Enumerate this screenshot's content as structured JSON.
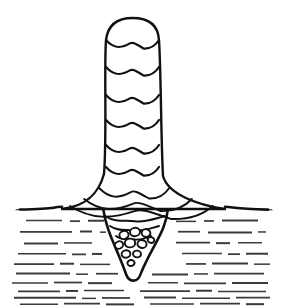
{
  "figure": {
    "medium": "pen-and-ink line drawing",
    "caption": "",
    "background_color": "#ffffff",
    "ink_color": "#111111",
    "canvas": {
      "width": 284,
      "height": 307
    }
  },
  "surface": {
    "name": "horizontal surface line",
    "y": 208,
    "x_start": 20,
    "x_end": 268,
    "stroke_width_center": 3.0,
    "stroke_width_edge": 1.0
  },
  "column": {
    "name": "vertical stalk",
    "top_y": 18,
    "base_y": 208,
    "left_x": 105,
    "right_x": 160,
    "cap_shape": "rounded dome",
    "flare_bottom_left_x": 62,
    "flare_bottom_right_x": 225,
    "segment_count": 9,
    "segment_arc_y": [
      40,
      67,
      95,
      120,
      145,
      167,
      188,
      199,
      206
    ],
    "arc_shape": "shallow double-hump"
  },
  "root": {
    "name": "submerged tapering root",
    "top_y": 208,
    "tip_y": 280,
    "tip_x": 133,
    "left_x": 103,
    "right_x": 168,
    "shape": "inverted V / funnel",
    "inner_arc_y": [
      216,
      226,
      236
    ]
  },
  "bubbles": {
    "name": "bubble cluster inside root",
    "count": 10,
    "items": [
      {
        "cx": 124,
        "cy": 235,
        "rx": 4.6,
        "ry": 4.0,
        "rot": -18
      },
      {
        "cx": 135,
        "cy": 232,
        "rx": 5.0,
        "ry": 4.2,
        "rot": -8
      },
      {
        "cx": 146,
        "cy": 233,
        "rx": 4.4,
        "ry": 3.8,
        "rot": 10
      },
      {
        "cx": 119,
        "cy": 245,
        "rx": 4.2,
        "ry": 3.6,
        "rot": -25
      },
      {
        "cx": 130,
        "cy": 243,
        "rx": 5.2,
        "ry": 4.4,
        "rot": -5
      },
      {
        "cx": 142,
        "cy": 244,
        "rx": 4.6,
        "ry": 3.9,
        "rot": 14
      },
      {
        "cx": 126,
        "cy": 254,
        "rx": 4.4,
        "ry": 3.7,
        "rot": -12
      },
      {
        "cx": 137,
        "cy": 254,
        "rx": 4.0,
        "ry": 3.4,
        "rot": 8
      },
      {
        "cx": 131,
        "cy": 263,
        "rx": 3.6,
        "ry": 3.0,
        "rot": -4
      },
      {
        "cx": 151,
        "cy": 240,
        "rx": 3.4,
        "ry": 2.9,
        "rot": 20
      }
    ]
  },
  "hatching": {
    "name": "dashed horizontal hatch lines below surface",
    "line_count": 10,
    "stroke_color": "#3a3a3a",
    "rows": [
      {
        "y": 221,
        "segments": [
          [
            26,
            62
          ],
          [
            70,
            80
          ],
          [
            88,
            104
          ],
          [
            176,
            196
          ],
          [
            204,
            214
          ],
          [
            222,
            258
          ]
        ]
      },
      {
        "y": 232,
        "segments": [
          [
            20,
            72
          ],
          [
            80,
            92
          ],
          [
            100,
            106
          ],
          [
            178,
            200
          ],
          [
            208,
            252
          ],
          [
            258,
            266
          ]
        ]
      },
      {
        "y": 243,
        "segments": [
          [
            24,
            58
          ],
          [
            64,
            92
          ],
          [
            176,
            210
          ],
          [
            216,
            230
          ],
          [
            238,
            262
          ]
        ]
      },
      {
        "y": 254,
        "segments": [
          [
            18,
            66
          ],
          [
            72,
            86
          ],
          [
            92,
            102
          ],
          [
            182,
            222
          ],
          [
            228,
            240
          ],
          [
            246,
            268
          ]
        ]
      },
      {
        "y": 264,
        "segments": [
          [
            14,
            54
          ],
          [
            60,
            74
          ],
          [
            80,
            110
          ],
          [
            186,
            206
          ],
          [
            212,
            248
          ],
          [
            254,
            270
          ]
        ]
      },
      {
        "y": 274,
        "segments": [
          [
            16,
            70
          ],
          [
            76,
            88
          ],
          [
            96,
            118
          ],
          [
            152,
            188
          ],
          [
            194,
            208
          ],
          [
            214,
            264
          ]
        ]
      },
      {
        "y": 283,
        "segments": [
          [
            12,
            48
          ],
          [
            54,
            82
          ],
          [
            88,
            112
          ],
          [
            148,
            178
          ],
          [
            184,
            226
          ],
          [
            232,
            268
          ]
        ]
      },
      {
        "y": 291,
        "segments": [
          [
            18,
            60
          ],
          [
            66,
            78
          ],
          [
            84,
            124
          ],
          [
            140,
            190
          ],
          [
            196,
            212
          ],
          [
            218,
            266
          ]
        ]
      },
      {
        "y": 298,
        "segments": [
          [
            14,
            76
          ],
          [
            82,
            96
          ],
          [
            102,
            130
          ],
          [
            144,
            176
          ],
          [
            182,
            230
          ],
          [
            236,
            270
          ]
        ]
      },
      {
        "y": 304,
        "segments": [
          [
            20,
            58
          ],
          [
            64,
            100
          ],
          [
            106,
            134
          ],
          [
            150,
            194
          ],
          [
            200,
            240
          ],
          [
            246,
            264
          ]
        ]
      }
    ]
  }
}
